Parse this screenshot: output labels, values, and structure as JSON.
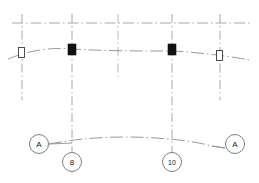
{
  "drawing": {
    "title": "Structural Grid Plan Fragment",
    "background_color": "#ffffff",
    "line_color": "#9a9a9a",
    "dark_line_color": "#4a4a4a",
    "marker_fill_color": "#111111",
    "marker_hollow_color": "#ffffff",
    "text_color": "#1a1a1a",
    "width": 259,
    "height": 183
  },
  "grid_bubbles": [
    {
      "id": "bubble-a-left",
      "label": "A",
      "cx": 39,
      "cy": 144,
      "r": 10
    },
    {
      "id": "bubble-8",
      "label": "8",
      "cx": 72,
      "cy": 162,
      "r": 10
    },
    {
      "id": "bubble-10",
      "label": "10",
      "cx": 172,
      "cy": 162,
      "r": 10
    },
    {
      "id": "bubble-a-right",
      "label": "A",
      "cx": 235,
      "cy": 144,
      "r": 10
    }
  ],
  "column_markers": [
    {
      "id": "marker-left-hollow",
      "type": "hollow",
      "x": 22,
      "y": 53
    },
    {
      "id": "marker-grid-8-filled",
      "type": "filled",
      "x": 72,
      "y": 50
    },
    {
      "id": "marker-grid-10-filled",
      "type": "filled",
      "x": 172,
      "y": 50
    },
    {
      "id": "marker-right-hollow",
      "type": "hollow",
      "x": 220,
      "y": 55
    }
  ],
  "grid_lines_vertical": [
    {
      "id": "gridline-v-1",
      "x": 22,
      "y_top": 18,
      "y_bottom": 100
    },
    {
      "id": "gridline-v-2",
      "x": 72,
      "y_top": 18,
      "y_bottom": 152
    },
    {
      "id": "gridline-v-3",
      "x": 118,
      "y_top": 18,
      "y_bottom": 78
    },
    {
      "id": "gridline-v-4",
      "x": 172,
      "y_top": 18,
      "y_bottom": 152
    },
    {
      "id": "gridline-v-5",
      "x": 220,
      "y_top": 18,
      "y_bottom": 100
    }
  ],
  "grid_lines_horizontal": [
    {
      "id": "gridline-h-top",
      "y": 23,
      "x_start": 12,
      "x_end": 252
    }
  ],
  "curves": [
    {
      "id": "curve-upper-alignment",
      "description": "upper alignment arc through column markers"
    },
    {
      "id": "curve-lower-alignment",
      "description": "lower alignment arc between A bubbles"
    }
  ]
}
